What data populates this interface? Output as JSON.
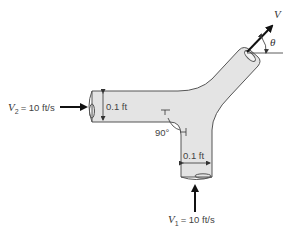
{
  "diagram": {
    "type": "pipe-y-junction",
    "inlet_2": {
      "symbol": "V",
      "subscript": "2",
      "value_text": "= 10 ft/s",
      "diameter": "0.1 ft"
    },
    "inlet_1": {
      "symbol": "V",
      "subscript": "1",
      "value_text": "= 10 ft/s",
      "diameter": "0.1 ft"
    },
    "outlet": {
      "velocity_symbol": "V",
      "angle_symbol": "θ"
    },
    "angle_label": "90°",
    "colors": {
      "pipe_fill": "#e4e4e4",
      "pipe_stroke": "#555555",
      "arrow": "#111111",
      "text": "#444444"
    }
  }
}
